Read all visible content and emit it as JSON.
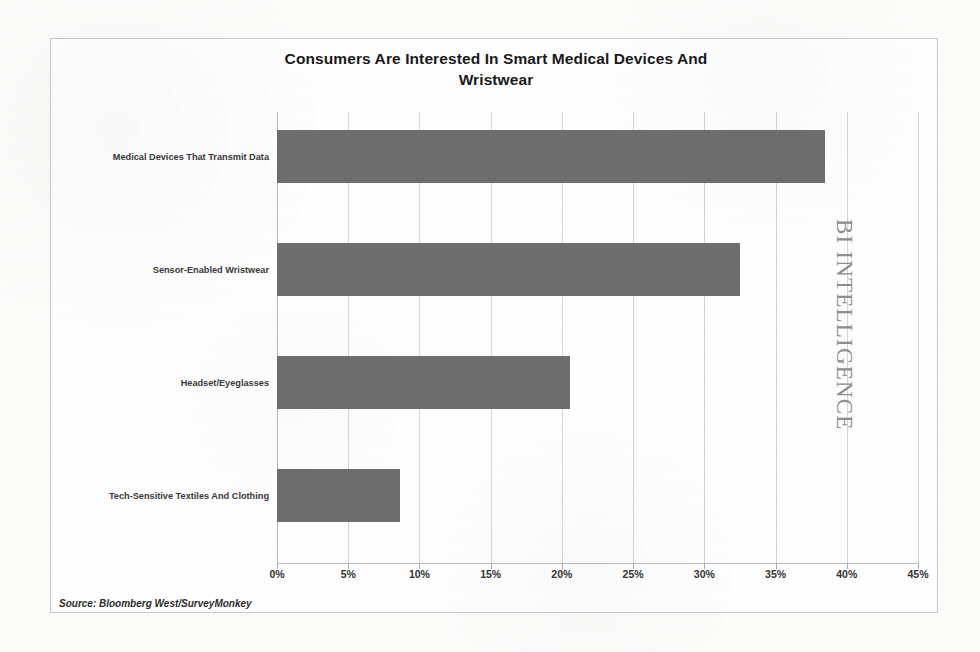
{
  "chart_data": {
    "type": "bar",
    "orientation": "horizontal",
    "title": "Consumers Are Interested In Smart Medical Devices And Wristwear",
    "title_line1": "Consumers Are Interested In Smart Medical Devices And",
    "title_line2": "Wristwear",
    "categories": [
      "Medical Devices That Transmit Data",
      "Sensor-Enabled Wristwear",
      "Headset/Eyeglasses",
      "Tech-Sensitive Textiles And Clothing"
    ],
    "values": [
      38.5,
      32.5,
      20.6,
      8.6
    ],
    "value_unit": "%",
    "xlabel": "",
    "ylabel": "",
    "xlim": [
      0,
      45
    ],
    "xticks": [
      0,
      5,
      10,
      15,
      20,
      25,
      30,
      35,
      40,
      45
    ],
    "xtick_labels": [
      "0%",
      "5%",
      "10%",
      "15%",
      "20%",
      "25%",
      "30%",
      "35%",
      "40%",
      "45%"
    ],
    "grid": "vertical",
    "legend": "none",
    "bar_color": "#6e6e6e",
    "gridline_color": "#d6d6d6",
    "plot_background": "#ffffff"
  },
  "source": {
    "text": "Source: Bloomberg West/SurveyMonkey"
  },
  "watermark": {
    "text": "BI INTELLIGENCE"
  }
}
